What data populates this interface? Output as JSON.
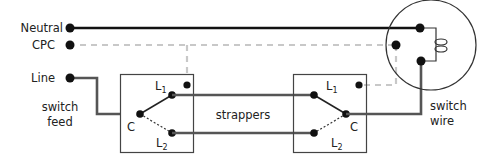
{
  "diagram": {
    "labels": {
      "neutral": "Neutral",
      "cpc": "CPC",
      "line": "Line",
      "switch_feed_1": "switch",
      "switch_feed_2": "feed",
      "strappers": "strappers",
      "switch_wire_1": "switch",
      "switch_wire_2": "wire"
    },
    "switches": [
      {
        "name": "switch-1",
        "terminals": {
          "l1": "L",
          "l1_sub": "1",
          "l2": "L",
          "l2_sub": "2",
          "common": "C"
        }
      },
      {
        "name": "switch-2",
        "terminals": {
          "l1": "L",
          "l1_sub": "1",
          "l2": "L",
          "l2_sub": "2",
          "common": "C"
        }
      }
    ],
    "lamp": {
      "name": "ceiling-rose"
    },
    "colors": {
      "neutral_wire": "#111111",
      "conductor": "#555555",
      "cpc": "#c8c8c8",
      "box_outline": "#444444",
      "text": "#222222"
    }
  }
}
